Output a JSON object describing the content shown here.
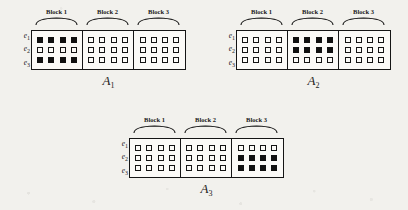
{
  "figures": [
    {
      "name": "A",
      "subscript": "1",
      "row_labels": [
        {
          "base": "e",
          "sub": "1"
        },
        {
          "base": "e",
          "sub": "2"
        },
        {
          "base": "e",
          "sub": "3"
        }
      ],
      "blocks": [
        {
          "label": "Block 1",
          "columns": 4,
          "rows": [
            [
              1,
              1,
              1,
              1
            ],
            [
              0,
              0,
              0,
              0
            ],
            [
              1,
              1,
              1,
              1
            ]
          ]
        },
        {
          "label": "Block 2",
          "columns": 4,
          "rows": [
            [
              0,
              0,
              0,
              0
            ],
            [
              0,
              0,
              0,
              0
            ],
            [
              0,
              0,
              0,
              0
            ]
          ]
        },
        {
          "label": "Block 3",
          "columns": 4,
          "rows": [
            [
              0,
              0,
              0,
              0
            ],
            [
              0,
              0,
              0,
              0
            ],
            [
              0,
              0,
              0,
              0
            ]
          ]
        }
      ]
    },
    {
      "name": "A",
      "subscript": "2",
      "row_labels": [
        {
          "base": "e",
          "sub": "1"
        },
        {
          "base": "e",
          "sub": "2"
        },
        {
          "base": "e",
          "sub": "3"
        }
      ],
      "blocks": [
        {
          "label": "Block 1",
          "columns": 4,
          "rows": [
            [
              0,
              0,
              0,
              0
            ],
            [
              0,
              0,
              0,
              0
            ],
            [
              0,
              0,
              0,
              0
            ]
          ]
        },
        {
          "label": "Block 2",
          "columns": 4,
          "rows": [
            [
              1,
              1,
              1,
              1
            ],
            [
              1,
              1,
              1,
              1
            ],
            [
              0,
              0,
              0,
              0
            ]
          ]
        },
        {
          "label": "Block 3",
          "columns": 4,
          "rows": [
            [
              0,
              0,
              0,
              0
            ],
            [
              0,
              0,
              0,
              0
            ],
            [
              0,
              0,
              0,
              0
            ]
          ]
        }
      ]
    },
    {
      "name": "A",
      "subscript": "3",
      "row_labels": [
        {
          "base": "e",
          "sub": "1"
        },
        {
          "base": "e",
          "sub": "2"
        },
        {
          "base": "e",
          "sub": "3"
        }
      ],
      "blocks": [
        {
          "label": "Block 1",
          "columns": 4,
          "rows": [
            [
              0,
              0,
              0,
              0
            ],
            [
              0,
              0,
              0,
              0
            ],
            [
              0,
              0,
              0,
              0
            ]
          ]
        },
        {
          "label": "Block 2",
          "columns": 4,
          "rows": [
            [
              0,
              0,
              0,
              0
            ],
            [
              0,
              0,
              0,
              0
            ],
            [
              0,
              0,
              0,
              0
            ]
          ]
        },
        {
          "label": "Block 3",
          "columns": 4,
          "rows": [
            [
              0,
              0,
              0,
              0
            ],
            [
              1,
              1,
              1,
              1
            ],
            [
              1,
              1,
              1,
              1
            ]
          ]
        }
      ]
    }
  ],
  "colors": {
    "ink": "#151515",
    "filled_cell": "#111111",
    "paper": "#f2f1ed",
    "cell_background": "#fbfaf7"
  },
  "layout": {
    "figure_positions": [
      {
        "left": 31,
        "top": 30
      },
      {
        "left": 236,
        "top": 30
      },
      {
        "left": 129,
        "top": 138
      }
    ],
    "block_width": 51,
    "frame_height": 40,
    "figure_name_top": 44
  }
}
